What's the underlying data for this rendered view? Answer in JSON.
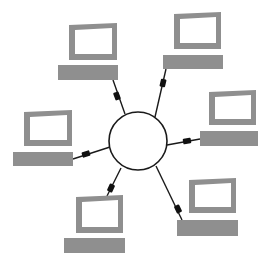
{
  "diagram": {
    "colors": {
      "background": "#ffffff",
      "computer_fill": "#8f8f8f",
      "screen_fill": "#ffffff",
      "line": "#1a1a1a",
      "connector": "#111111",
      "hub_fill": "#ffffff"
    },
    "hub": {
      "label": "hub",
      "cx": 138,
      "cy": 141,
      "r": 29
    },
    "nodes": [
      {
        "id": "computer-top-left",
        "monitor": {
          "x": 69,
          "y": 23,
          "w": 48,
          "h": 37,
          "skew": 2
        },
        "keyboard": {
          "x": 58,
          "y": 65,
          "w": 60,
          "h": 15
        },
        "cable": {
          "x1": 113,
          "y1": 80,
          "x2": 125,
          "y2": 114
        },
        "connector": {
          "x": 117,
          "y": 96,
          "angle": 70
        }
      },
      {
        "id": "computer-top-right",
        "monitor": {
          "x": 174,
          "y": 12,
          "w": 47,
          "h": 37,
          "skew": 2
        },
        "keyboard": {
          "x": 163,
          "y": 55,
          "w": 60,
          "h": 14
        },
        "cable": {
          "x1": 166,
          "y1": 69,
          "x2": 155,
          "y2": 117
        },
        "connector": {
          "x": 163,
          "y": 83,
          "angle": 103
        }
      },
      {
        "id": "computer-left",
        "monitor": {
          "x": 24,
          "y": 110,
          "w": 48,
          "h": 36,
          "skew": 2
        },
        "keyboard": {
          "x": 13,
          "y": 152,
          "w": 60,
          "h": 14
        },
        "cable": {
          "x1": 73,
          "y1": 159,
          "x2": 110,
          "y2": 147
        },
        "connector": {
          "x": 86,
          "y": 154,
          "angle": -18
        }
      },
      {
        "id": "computer-right",
        "monitor": {
          "x": 209,
          "y": 90,
          "w": 47,
          "h": 35,
          "skew": 2
        },
        "keyboard": {
          "x": 200,
          "y": 131,
          "w": 58,
          "h": 15
        },
        "cable": {
          "x1": 167,
          "y1": 145,
          "x2": 200,
          "y2": 139
        },
        "connector": {
          "x": 187,
          "y": 141,
          "angle": -10
        }
      },
      {
        "id": "computer-bottom-left",
        "monitor": {
          "x": 76,
          "y": 195,
          "w": 47,
          "h": 38,
          "skew": 2
        },
        "keyboard": {
          "x": 64,
          "y": 238,
          "w": 61,
          "h": 15
        },
        "cable": {
          "x1": 121,
          "y1": 168,
          "x2": 107,
          "y2": 196
        },
        "connector": {
          "x": 111,
          "y": 188,
          "angle": 115
        }
      },
      {
        "id": "computer-bottom-right",
        "monitor": {
          "x": 189,
          "y": 178,
          "w": 47,
          "h": 35,
          "skew": 2
        },
        "keyboard": {
          "x": 177,
          "y": 220,
          "w": 61,
          "h": 16
        },
        "cable": {
          "x1": 156,
          "y1": 166,
          "x2": 182,
          "y2": 220
        },
        "connector": {
          "x": 178,
          "y": 209,
          "angle": 64
        }
      }
    ]
  }
}
